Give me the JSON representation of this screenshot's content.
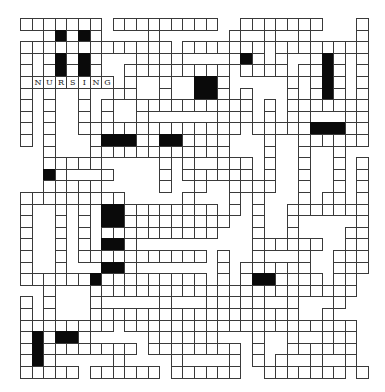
{
  "puzzle": {
    "type": "crossword",
    "cell_size": 11.6,
    "cols": 30,
    "rows": 31,
    "filled_entry": {
      "word": "NURSING",
      "row": 5,
      "col": 2,
      "direction": "across"
    },
    "legend": {
      ".": "empty",
      "W": "white-cell",
      "#": "black-cell"
    },
    "grid": [
      "WWWWWWW.WWWWWWWWW..WWWWWWW...W",
      "..W#W#W....W......W..W..W....W",
      "WWWWWWWWWWWWW.WWWWWWW.WWWWWWWW",
      "W.W#W#W...WW.W....W#W.W..W#W.W",
      "W.W#W#W..WWWWWWWWW.WWWW.WW#W.W",
      "WNURSING.W..W..##W.....W.W#W.W",
      "W.W..W..WW..W..##W.W...W.W#W.W",
      "W.W..W.W..WWWWWWWWWW.W.WWWWWWW",
      "W.W..W.W..W......W.W.W.WW...WW",
      "W.W..WWWWWWWWWWWWWW.WWWWW###WW",
      "W.W...W###WW##WW.W...W..WWWWWW",
      "..W...WWWWWWWWWWWW...W..W..W..",
      "..WWWWW.....W.W..WWW.W..W..W.W",
      "..#W...W....W.WWWWWW.W..W..W.W",
      "..WWWWW.....W..W..WWWW..W..W.W",
      "WWWWWWWWW.....W...W.W...W.WW.W",
      "W..W.W.##WWWWWWWW.W.W..WWWWWWW",
      "W..W.W.##WWWWWWWWW..W..W.....W",
      "W..W.W.WWWWWWWWWW...W..W....WW",
      "W..W.W.##W..........WWWWWW..WW",
      "W..W.WWWWWWWWWWW.W..W...W..WWW",
      "W..W...##W.......W.WWWWWW..W.W",
      "WWWWWW#WWWWWWWWW.W.W##WW.W.WW.",
      "..W...WWWWWWWWWWWWWWWWWWWWWWW.",
      "W.W...W.....W...W.W.W..W...W..",
      "W.W...WWWWWW.WWWWW.WWWWW..W...",
      "WWWWWWWW.WWWWWWWWWWWWWWWWWWWW.",
      "W#W##W.....W.W.WW...W..W..W.W.",
      "W#WWWWWWWW.WWWWWWWW.W..WWWWWW.",
      "W#W.....W....W....W.W.W..W..W.",
      "WWWWW.WWWWWW.WWWWWW..WWWWWWW.W"
    ]
  }
}
